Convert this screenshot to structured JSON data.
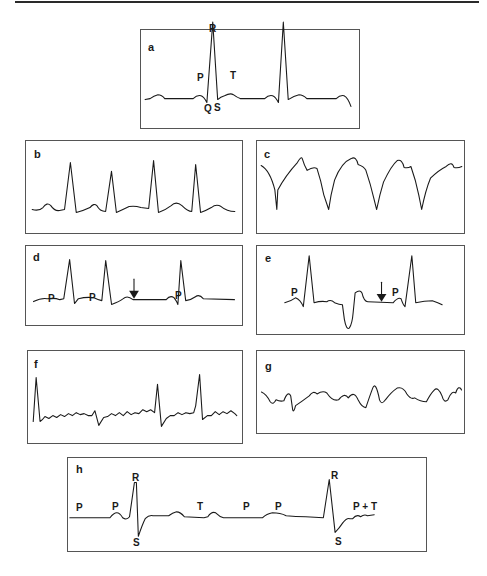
{
  "figure": {
    "panels": {
      "a": {
        "letter": "a",
        "labels": {
          "R": "R",
          "P": "P",
          "Q": "Q",
          "S": "S",
          "T": "T"
        }
      },
      "b": {
        "letter": "b"
      },
      "c": {
        "letter": "c"
      },
      "d": {
        "letter": "d",
        "labels": {
          "P1": "P",
          "P2": "P",
          "P3": "P"
        },
        "annotations": [
          "arrow-down"
        ]
      },
      "e": {
        "letter": "e",
        "labels": {
          "P1": "P",
          "P2": "P"
        },
        "annotations": [
          "arrow-down"
        ]
      },
      "f": {
        "letter": "f"
      },
      "g": {
        "letter": "g"
      },
      "h": {
        "letter": "h",
        "labels": {
          "P1": "P",
          "P2": "P",
          "R1": "R",
          "S1": "S",
          "T1": "T",
          "P3": "P",
          "P4": "P",
          "R2": "R",
          "S2": "S",
          "PT": "P + T"
        }
      }
    },
    "colors": {
      "trace": "#1a1a1a",
      "border": "#555555",
      "background": "#ffffff"
    }
  }
}
